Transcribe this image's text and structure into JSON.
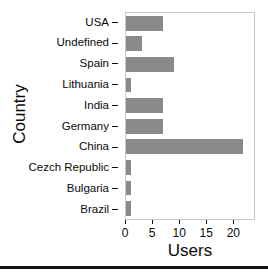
{
  "chart_data": {
    "type": "bar",
    "orientation": "horizontal",
    "title": "",
    "xlabel": "Users",
    "ylabel": "Country",
    "categories": [
      "USA",
      "Undefined",
      "Spain",
      "Lithuania",
      "India",
      "Germany",
      "China",
      "Cezch Republic",
      "Bulgaria",
      "Brazil"
    ],
    "values": [
      7,
      3,
      9,
      1,
      7,
      7,
      22,
      1,
      1,
      1
    ],
    "xlim": [
      0,
      24
    ],
    "ylim_categorical": true,
    "xticks": [
      0,
      5,
      10,
      15,
      20
    ],
    "xticklabels": [
      "0",
      "5",
      "10",
      "15",
      "20"
    ],
    "grid": false,
    "legend": null,
    "bar_color": "#8a8a8a",
    "panel_background": "#ffffff",
    "panel_border_color": "#c8c8c8",
    "text_color": "#0a0a0a"
  },
  "axes": {
    "x_title": "Users",
    "y_title": "Country"
  },
  "rows": [
    {
      "label": "USA",
      "value": 7
    },
    {
      "label": "Undefined",
      "value": 3
    },
    {
      "label": "Spain",
      "value": 9
    },
    {
      "label": "Lithuania",
      "value": 1
    },
    {
      "label": "India",
      "value": 7
    },
    {
      "label": "Germany",
      "value": 7
    },
    {
      "label": "China",
      "value": 22
    },
    {
      "label": "Cezch Republic",
      "value": 1
    },
    {
      "label": "Bulgaria",
      "value": 1
    },
    {
      "label": "Brazil",
      "value": 1
    }
  ]
}
